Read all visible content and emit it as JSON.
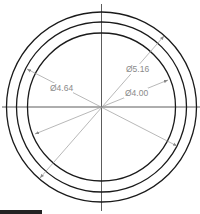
{
  "diagram": {
    "type": "concentric-circles-dimension-drawing",
    "center": {
      "x": 101.5,
      "y": 107
    },
    "circles": [
      {
        "name": "outer",
        "r": 95
      },
      {
        "name": "middle",
        "r": 85
      },
      {
        "name": "inner",
        "r": 74
      }
    ],
    "dimensions": [
      {
        "label": "Ø5.16",
        "x1": 40,
        "y1": 178,
        "x2": 164,
        "y2": 36,
        "text_x": 126,
        "text_y": 72
      },
      {
        "label": "Ø4.64",
        "x1": 27,
        "y1": 69,
        "x2": 177,
        "y2": 146,
        "text_x": 50,
        "text_y": 91
      },
      {
        "label": "Ø4.00",
        "x1": 35,
        "y1": 134,
        "x2": 168,
        "y2": 80,
        "text_x": 125,
        "text_y": 96
      }
    ],
    "colors": {
      "circle_stroke": "#1a1a1a",
      "dimension_stroke": "#9a9a9a",
      "dimension_text": "#8a8a8a",
      "centerline": "#333333"
    }
  }
}
